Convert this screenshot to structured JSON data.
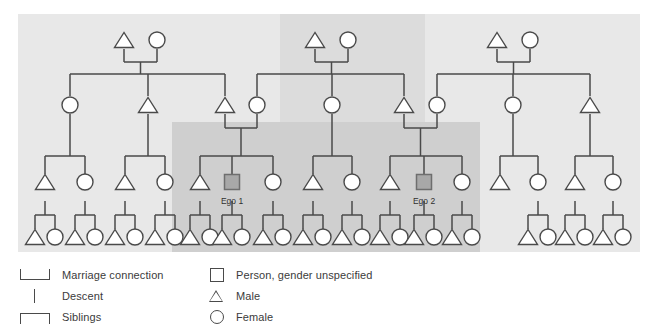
{
  "diagram": {
    "colors": {
      "background": "#ffffff",
      "panel": "#e8e8e8",
      "highlight_band": "#d6d6d6",
      "highlight_block": "#cccccc",
      "line": "#4a4a4a",
      "node_fill": "#ffffff",
      "ego_fill": "#a8a8a8",
      "text": "#3b3b3b"
    },
    "ego_labels": [
      {
        "id": "ego1",
        "text": "Ego 1",
        "x": 232,
        "y": 196
      },
      {
        "id": "ego2",
        "text": "Ego 2",
        "x": 424,
        "y": 196
      }
    ],
    "generations": {
      "g1_label": "Grandparents",
      "g2_label": "Parents generation",
      "g3_label": "Ego generation",
      "g4_label": "Children generation"
    },
    "g1_couples": [
      {
        "male_x": 124,
        "female_x": 157,
        "y": 40,
        "child_x": 140
      },
      {
        "male_x": 315,
        "female_x": 348,
        "y": 40,
        "child_x": 331
      },
      {
        "male_x": 497,
        "female_x": 530,
        "y": 40,
        "child_x": 513
      }
    ],
    "g2_nodes": [
      {
        "x": 70,
        "y": 105,
        "shape": "circle"
      },
      {
        "x": 148,
        "y": 105,
        "shape": "male"
      },
      {
        "x": 225,
        "y": 105,
        "shape": "male"
      },
      {
        "x": 257,
        "y": 105,
        "shape": "circle"
      },
      {
        "x": 332,
        "y": 105,
        "shape": "circle"
      },
      {
        "x": 404,
        "y": 105,
        "shape": "male"
      },
      {
        "x": 437,
        "y": 105,
        "shape": "circle"
      },
      {
        "x": 513,
        "y": 105,
        "shape": "circle"
      },
      {
        "x": 590,
        "y": 105,
        "shape": "male"
      }
    ],
    "g3_nodes": [
      {
        "x": 45,
        "y": 182,
        "shape": "male"
      },
      {
        "x": 85,
        "y": 182,
        "shape": "circle"
      },
      {
        "x": 125,
        "y": 182,
        "shape": "male"
      },
      {
        "x": 165,
        "y": 182,
        "shape": "circle"
      },
      {
        "x": 200,
        "y": 182,
        "shape": "male"
      },
      {
        "x": 232,
        "y": 182,
        "shape": "ego"
      },
      {
        "x": 273,
        "y": 182,
        "shape": "circle"
      },
      {
        "x": 313,
        "y": 182,
        "shape": "male"
      },
      {
        "x": 352,
        "y": 182,
        "shape": "circle"
      },
      {
        "x": 390,
        "y": 182,
        "shape": "male"
      },
      {
        "x": 424,
        "y": 182,
        "shape": "ego"
      },
      {
        "x": 462,
        "y": 182,
        "shape": "circle"
      },
      {
        "x": 500,
        "y": 182,
        "shape": "male"
      },
      {
        "x": 538,
        "y": 182,
        "shape": "circle"
      },
      {
        "x": 575,
        "y": 182,
        "shape": "male"
      },
      {
        "x": 613,
        "y": 182,
        "shape": "circle"
      }
    ],
    "g4_pairs": [
      {
        "cx": 45,
        "y": 237
      },
      {
        "cx": 85,
        "y": 237
      },
      {
        "cx": 125,
        "y": 237
      },
      {
        "cx": 165,
        "y": 237
      },
      {
        "cx": 200,
        "y": 237
      },
      {
        "cx": 232,
        "y": 237
      },
      {
        "cx": 273,
        "y": 237
      },
      {
        "cx": 313,
        "y": 237
      },
      {
        "cx": 352,
        "y": 237
      },
      {
        "cx": 390,
        "y": 237
      },
      {
        "cx": 424,
        "y": 237
      },
      {
        "cx": 462,
        "y": 237
      },
      {
        "cx": 538,
        "y": 237
      },
      {
        "cx": 575,
        "y": 237
      },
      {
        "cx": 613,
        "y": 237
      }
    ]
  },
  "legend": {
    "left_column": [
      {
        "icon": "marriage-bracket-icon",
        "label": "Marriage connection"
      },
      {
        "icon": "descent-line-icon",
        "label": "Descent"
      },
      {
        "icon": "siblings-bracket-icon",
        "label": "Siblings"
      }
    ],
    "right_column": [
      {
        "icon": "square-icon",
        "label": "Person, gender unspecified"
      },
      {
        "icon": "triangle-icon",
        "label": "Male"
      },
      {
        "icon": "circle-icon",
        "label": "Female"
      }
    ]
  }
}
